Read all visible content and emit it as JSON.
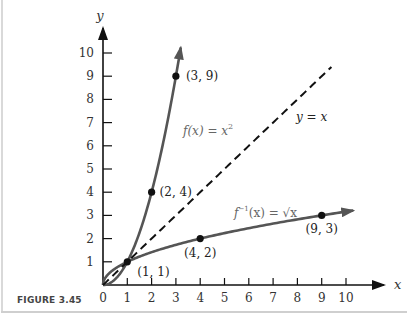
{
  "figure": {
    "caption": "FIGURE 3.45"
  },
  "chart_data": {
    "type": "line",
    "title": "",
    "xlabel": "x",
    "ylabel": "y",
    "xlim": [
      0,
      10
    ],
    "ylim": [
      0,
      10
    ],
    "grid": false,
    "x_ticks": [
      0,
      1,
      2,
      3,
      4,
      5,
      6,
      7,
      8,
      9,
      10
    ],
    "y_ticks": [
      1,
      2,
      3,
      4,
      5,
      6,
      7,
      8,
      9,
      10
    ],
    "series": [
      {
        "name": "f(x) = x^2",
        "label_text": "f(x) = x",
        "label_sup": "2",
        "function": "square",
        "domain": [
          0,
          3.2
        ],
        "style": "solid",
        "color": "#555555",
        "marked_points": [
          {
            "x": 1,
            "y": 1,
            "label": "(1, 1)"
          },
          {
            "x": 2,
            "y": 4,
            "label": "(2, 4)"
          },
          {
            "x": 3,
            "y": 9,
            "label": "(3, 9)"
          }
        ]
      },
      {
        "name": "f^-1(x) = sqrt(x)",
        "label_text": "f",
        "label_sup": "−1",
        "label_rest": "(x) = √x",
        "function": "sqrt",
        "domain": [
          0,
          10.3
        ],
        "style": "solid",
        "color": "#555555",
        "marked_points": [
          {
            "x": 4,
            "y": 2,
            "label": "(4, 2)"
          },
          {
            "x": 9,
            "y": 3,
            "label": "(9, 3)"
          }
        ]
      },
      {
        "name": "y = x",
        "label_text": "y = x",
        "function": "identity",
        "domain": [
          0,
          9.4
        ],
        "style": "dashed",
        "color": "#111111"
      }
    ]
  }
}
